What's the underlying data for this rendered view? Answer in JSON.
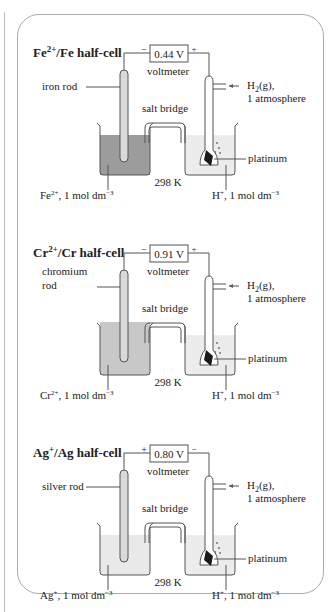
{
  "cells": [
    {
      "title": "Fe2+/Fe half-cell",
      "title_base": "Fe",
      "title_sup": "2+",
      "title_rest": "/Fe half-cell",
      "voltage": "0.44 V",
      "left_sign": "−",
      "right_sign": "+",
      "voltmeter_label": "voltmeter",
      "rod_label_line1": "iron rod",
      "rod_label_line2": "",
      "gas_label_line1": "H2(g),",
      "gas_label_line2": "1 atmosphere",
      "salt_bridge_label": "salt bridge",
      "platinum_label": "platinum",
      "temperature": "298 K",
      "left_solution": "Fe2+, 1 mol dm-3",
      "left_solution_ion": "Fe",
      "left_solution_sup": "2+",
      "right_solution": "H+, 1 mol dm-3",
      "left_liquid_color": "#9c9c9c"
    },
    {
      "title": "Cr2+/Cr half-cell",
      "title_base": "Cr",
      "title_sup": "2+",
      "title_rest": "/Cr half-cell",
      "voltage": "0.91 V",
      "left_sign": "−",
      "right_sign": "+",
      "voltmeter_label": "voltmeter",
      "rod_label_line1": "chromium",
      "rod_label_line2": "rod",
      "gas_label_line1": "H2(g),",
      "gas_label_line2": "1 atmosphere",
      "salt_bridge_label": "salt bridge",
      "platinum_label": "platinum",
      "temperature": "298 K",
      "left_solution": "Cr2+, 1 mol dm-3",
      "left_solution_ion": "Cr",
      "left_solution_sup": "2+",
      "right_solution": "H+, 1 mol dm-3",
      "left_liquid_color": "#c8c8c8"
    },
    {
      "title": "Ag+/Ag half-cell",
      "title_base": "Ag",
      "title_sup": "+",
      "title_rest": "/Ag half-cell",
      "voltage": "0.80 V",
      "left_sign": "+",
      "right_sign": "−",
      "voltmeter_label": "voltmeter",
      "rod_label_line1": "silver rod",
      "rod_label_line2": "",
      "gas_label_line1": "H2(g),",
      "gas_label_line2": "1 atmosphere",
      "salt_bridge_label": "salt bridge",
      "platinum_label": "platinum",
      "temperature": "298 K",
      "left_solution": "Ag+, 1 mol dm-3",
      "left_solution_ion": "Ag",
      "left_solution_sup": "+",
      "right_solution": "H+, 1 mol dm-3",
      "left_liquid_color": "#e9e9e9"
    }
  ],
  "common": {
    "mol_unit": ", 1 mol dm",
    "mol_exp": "−3",
    "h_ion": "H",
    "h_sup": "+",
    "h2_base": "H",
    "h2_sub": "2",
    "h2_rest": "(g),"
  },
  "colors": {
    "outline": "#555555",
    "right_liquid": "#ececec",
    "rod_fill": "#d9d9d9",
    "platinum": "#1a1a1a",
    "panel_border": "#aaaaaa"
  }
}
